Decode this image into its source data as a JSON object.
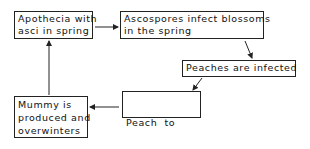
{
  "diagram": {
    "type": "flowchart-cycle",
    "nodes": [
      {
        "id": "apothecia",
        "lines": [
          "Apothecia with",
          "asci in spring"
        ]
      },
      {
        "id": "ascospores",
        "lines": [
          "Ascospores infect blossoms",
          "in the spring"
        ]
      },
      {
        "id": "peaches",
        "lines": [
          "Peaches are infected"
        ]
      },
      {
        "id": "peach-to-peach",
        "lines": [
          "Peach  to",
          "peach infection"
        ]
      },
      {
        "id": "mummy",
        "lines": [
          "Mummy is",
          "produced and",
          "overwinters"
        ]
      }
    ],
    "edges": [
      {
        "from": "apothecia",
        "to": "ascospores"
      },
      {
        "from": "ascospores",
        "to": "peaches"
      },
      {
        "from": "peaches",
        "to": "peach-to-peach"
      },
      {
        "from": "peach-to-peach",
        "to": "mummy"
      },
      {
        "from": "mummy",
        "to": "apothecia"
      }
    ],
    "colors": {
      "line": "#222222",
      "background": "#ffffff"
    }
  }
}
